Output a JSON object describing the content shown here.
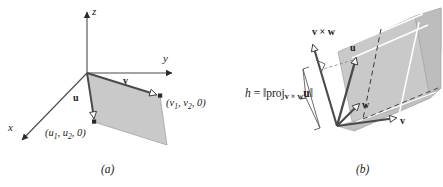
{
  "figure": {
    "panels": [
      {
        "id": "panel-a",
        "caption": "(a)",
        "axes": [
          {
            "name": "z-axis",
            "label": "z"
          },
          {
            "name": "y-axis",
            "label": "y"
          },
          {
            "name": "x-axis",
            "label": "x"
          }
        ],
        "vectors": [
          {
            "name": "vector-u",
            "label": "u"
          },
          {
            "name": "vector-v",
            "label": "v"
          }
        ],
        "points": [
          {
            "name": "point-u",
            "label": "(u1, u2, 0)",
            "var": "u",
            "sub1": "1",
            "sub2": "2",
            "tail": ", 0)"
          },
          {
            "name": "point-v",
            "label": "(v1, v2, 0)",
            "var": "v",
            "sub1": "1",
            "sub2": "2",
            "tail": ", 0)"
          }
        ]
      },
      {
        "id": "panel-b",
        "caption": "(b)",
        "vectors": [
          {
            "name": "vector-cross-vw",
            "label": "v × w"
          },
          {
            "name": "vector-u",
            "label": "u"
          },
          {
            "name": "vector-w",
            "label": "w"
          },
          {
            "name": "vector-v",
            "label": "v"
          }
        ],
        "formula": {
          "name": "height-formula",
          "text": "h = ‖proj_{v × w} u‖",
          "lhs": "h",
          "equals": "=",
          "norm_open": "‖",
          "proj": "proj",
          "subscript": "v × w",
          "operand": "u",
          "norm_close": "‖"
        },
        "markers": [
          {
            "name": "right-angle-marker"
          },
          {
            "name": "height-bracket"
          }
        ]
      }
    ]
  },
  "colors": {
    "fill_gray": "#c9c9c9",
    "fill_gray_dark": "#bdbdbd",
    "stroke_dark": "#3a3a3a",
    "stroke_light": "#8a8a8a",
    "highlight_white": "#ffffff",
    "text": "#1a1a1a"
  }
}
